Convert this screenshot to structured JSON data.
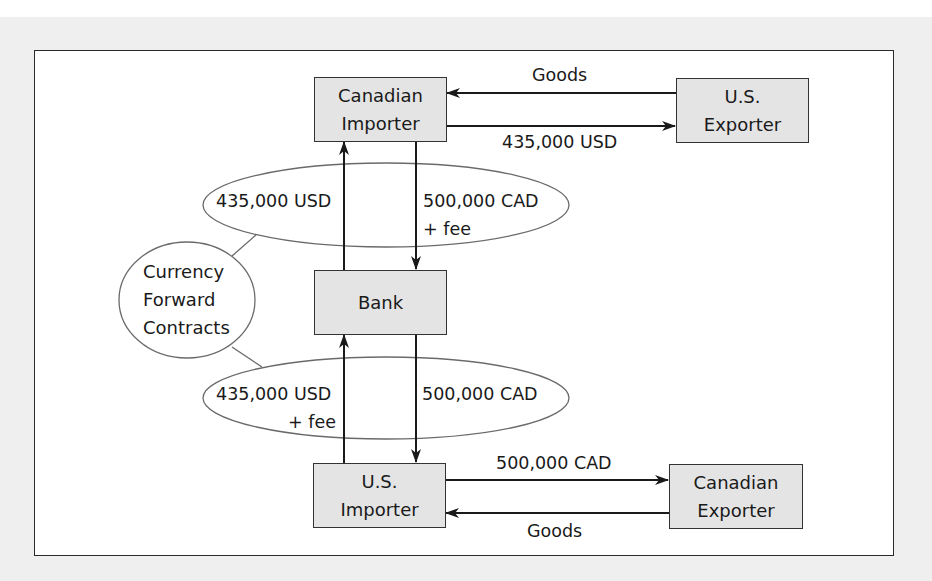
{
  "diagram": {
    "nodes": {
      "canadian_importer": {
        "line1": "Canadian",
        "line2": "Importer"
      },
      "us_exporter": {
        "line1": "U.S.",
        "line2": "Exporter"
      },
      "bank": {
        "label": "Bank"
      },
      "us_importer": {
        "line1": "U.S.",
        "line2": "Importer"
      },
      "canadian_exporter": {
        "line1": "Canadian",
        "line2": "Exporter"
      },
      "currency_forward_contracts": {
        "line1": "Currency",
        "line2": "Forward",
        "line3": "Contracts"
      }
    },
    "flows": {
      "top_goods": "Goods",
      "top_payment": "435,000 USD",
      "upper_contract_usd": "435,000 USD",
      "upper_contract_cad": "500,000 CAD",
      "upper_contract_fee": "+ fee",
      "lower_contract_usd": "435,000 USD",
      "lower_contract_fee": "+ fee",
      "lower_contract_cad": "500,000 CAD",
      "bottom_payment": "500,000 CAD",
      "bottom_goods": "Goods"
    },
    "colors": {
      "box_fill": "#e4e4e4",
      "line": "#1a1a1a",
      "ellipse_stroke": "#666666",
      "background": "#efefef"
    }
  }
}
